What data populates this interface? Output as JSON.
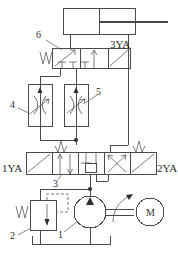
{
  "diagram": {
    "type": "hydraulic-schematic",
    "colors": {
      "line": "#4a4a4a",
      "line_light": "#6b6b6b",
      "fill": "#2e2e2e",
      "background": "#ffffff",
      "text": "#2b2b2b"
    }
  },
  "labels": {
    "solenoid_3ya": "3YA",
    "solenoid_1ya": "1YA",
    "solenoid_2ya": "2YA",
    "motor": "M",
    "item_1": "1",
    "item_2": "2",
    "item_3": "3",
    "item_4": "4",
    "item_5": "5",
    "item_6": "6"
  },
  "components": [
    {
      "id": "1",
      "name": "hydraulic-pump",
      "symbol": "circle-with-filled-triangle",
      "label": "1"
    },
    {
      "id": "2",
      "name": "pressure-relief-valve",
      "symbol": "spring-loaded-relief-valve",
      "label": "2"
    },
    {
      "id": "3",
      "name": "directional-control-valve-main",
      "symbol": "3-position-4-way-valve",
      "label": "3",
      "solenoids": [
        "1YA",
        "2YA"
      ]
    },
    {
      "id": "4",
      "name": "flow-control-valve-left",
      "symbol": "adjustable-throttle",
      "label": "4"
    },
    {
      "id": "5",
      "name": "flow-control-valve-right",
      "symbol": "adjustable-throttle",
      "label": "5"
    },
    {
      "id": "6",
      "name": "directional-control-valve-upper",
      "symbol": "2-position-valve",
      "label": "6",
      "solenoids": [
        "3YA"
      ]
    },
    {
      "id": "cyl",
      "name": "hydraulic-cylinder",
      "symbol": "double-acting-cylinder",
      "label": ""
    },
    {
      "id": "motor",
      "name": "electric-motor",
      "symbol": "circle-M",
      "label": "M"
    },
    {
      "id": "tank",
      "name": "reservoir-tank",
      "symbol": "open-tank",
      "label": ""
    }
  ]
}
